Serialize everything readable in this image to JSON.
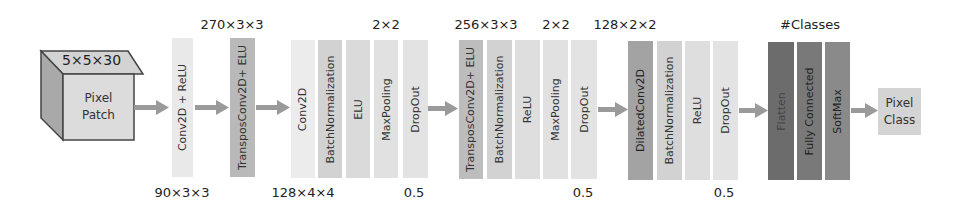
{
  "input": {
    "shape_label": "5×5×30",
    "line1": "Pixel",
    "line2": "Patch",
    "colors": {
      "front": "#dcdcdc",
      "top": "#d3d3d3",
      "side": "#a9a9a9",
      "stroke": "#444444"
    }
  },
  "output": {
    "line1": "Pixel",
    "line2": "Class",
    "color": "#d4d4d4"
  },
  "arrow_color": "#9a9a9a",
  "blocks": [
    {
      "label": "Conv2D + ReLU",
      "color": "#e9e9e9"
    },
    {
      "label": "TransposConv2D+ ELU",
      "color": "#b9b9b9"
    },
    {
      "label": "Conv2D",
      "color": "#ececec"
    },
    {
      "label": "BatchNormalization",
      "color": "#d2d2d2"
    },
    {
      "label": "ELU",
      "color": "#dadada"
    },
    {
      "label": "MaxPooling",
      "color": "#e1e1e1"
    },
    {
      "label": "DropOut",
      "color": "#e3e3e3"
    },
    {
      "label": "TransposConv2D+ ELU",
      "color": "#bdbdbd"
    },
    {
      "label": "BatchNormalization",
      "color": "#d2d2d2"
    },
    {
      "label": "ReLU",
      "color": "#dedede"
    },
    {
      "label": "MaxPooling",
      "color": "#e1e1e1"
    },
    {
      "label": "DropOut",
      "color": "#e3e3e3"
    },
    {
      "label": "DilatedConv2D",
      "color": "#a3a3a3"
    },
    {
      "label": "BatchNormalization",
      "color": "#d2d2d2"
    },
    {
      "label": "ReLU",
      "color": "#dedede"
    },
    {
      "label": "DropOut",
      "color": "#e3e3e3"
    },
    {
      "label": "Flatten",
      "color": "#6c6c6c"
    },
    {
      "label": "Fully Connected",
      "color": "#797979"
    },
    {
      "label": "SoftMax",
      "color": "#8a8a8a"
    }
  ],
  "top_labels": [
    {
      "text": "270×3×3"
    },
    {
      "text": "2×2"
    },
    {
      "text": "256×3×3"
    },
    {
      "text": "2×2"
    },
    {
      "text": "128×2×2"
    },
    {
      "text": "#Classes"
    }
  ],
  "bottom_labels": [
    {
      "text": "90×3×3"
    },
    {
      "text": "128×4×4"
    },
    {
      "text": "0.5"
    },
    {
      "text": "0.5"
    },
    {
      "text": "0.5"
    }
  ]
}
